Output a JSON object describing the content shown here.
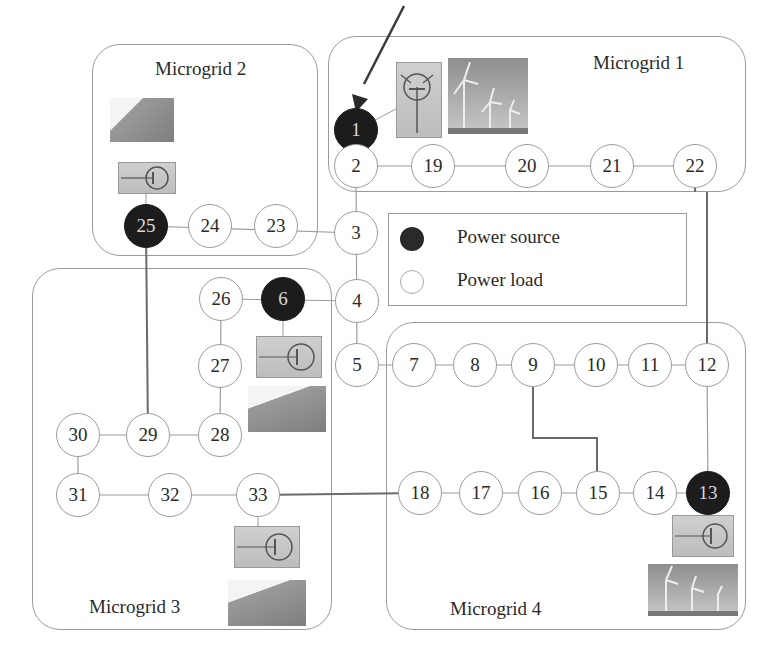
{
  "diagram": {
    "type": "power-distribution-network",
    "microgrids": [
      {
        "id": "mg1",
        "label": "Microgrid 1",
        "generation": "wind"
      },
      {
        "id": "mg2",
        "label": "Microgrid 2",
        "generation": "solar"
      },
      {
        "id": "mg3",
        "label": "Microgrid 3",
        "generation": "solar"
      },
      {
        "id": "mg4",
        "label": "Microgrid 4",
        "generation": "wind"
      }
    ],
    "legend": {
      "source_label": "Power source",
      "load_label": "Power load"
    },
    "nodes": {
      "n1": "1",
      "n2": "2",
      "n3": "3",
      "n4": "4",
      "n5": "5",
      "n6": "6",
      "n7": "7",
      "n8": "8",
      "n9": "9",
      "n10": "10",
      "n11": "11",
      "n12": "12",
      "n13": "13",
      "n14": "14",
      "n15": "15",
      "n16": "16",
      "n17": "17",
      "n18": "18",
      "n19": "19",
      "n20": "20",
      "n21": "21",
      "n22": "22",
      "n23": "23",
      "n24": "24",
      "n25": "25",
      "n26": "26",
      "n27": "27",
      "n28": "28",
      "n29": "29",
      "n30": "30",
      "n31": "31",
      "n32": "32",
      "n33": "33"
    },
    "power_sources": [
      "1",
      "6",
      "13",
      "25"
    ],
    "edges": [
      [
        "1",
        "2"
      ],
      [
        "2",
        "19"
      ],
      [
        "19",
        "20"
      ],
      [
        "20",
        "21"
      ],
      [
        "21",
        "22"
      ],
      [
        "2",
        "3"
      ],
      [
        "3",
        "4"
      ],
      [
        "4",
        "5"
      ],
      [
        "5",
        "7"
      ],
      [
        "7",
        "8"
      ],
      [
        "8",
        "9"
      ],
      [
        "9",
        "10"
      ],
      [
        "10",
        "11"
      ],
      [
        "11",
        "12"
      ],
      [
        "25",
        "24"
      ],
      [
        "24",
        "23"
      ],
      [
        "23",
        "3"
      ],
      [
        "4",
        "6"
      ],
      [
        "6",
        "26"
      ],
      [
        "26",
        "27"
      ],
      [
        "27",
        "28"
      ],
      [
        "28",
        "29"
      ],
      [
        "29",
        "30"
      ],
      [
        "30",
        "31"
      ],
      [
        "31",
        "32"
      ],
      [
        "32",
        "33"
      ],
      [
        "13",
        "14"
      ],
      [
        "14",
        "15"
      ],
      [
        "15",
        "16"
      ],
      [
        "16",
        "17"
      ],
      [
        "17",
        "18"
      ]
    ],
    "tie_lines": [
      [
        "22",
        "12"
      ],
      [
        "25",
        "29"
      ],
      [
        "9",
        "15"
      ],
      [
        "33",
        "18"
      ],
      [
        "12",
        "13"
      ]
    ],
    "colors": {
      "source_fill": "#1c1c1c",
      "load_fill": "#ffffff",
      "line": "#9c9c9c",
      "tie_line": "#6a6a6a"
    }
  }
}
